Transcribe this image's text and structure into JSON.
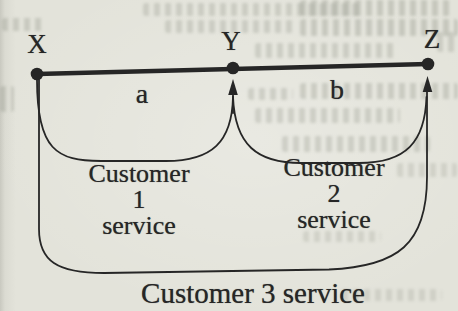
{
  "figure": {
    "points": [
      {
        "label": "X"
      },
      {
        "label": "Y"
      },
      {
        "label": "Z"
      }
    ],
    "segments": [
      {
        "label": "a",
        "between": "X-Y"
      },
      {
        "label": "b",
        "between": "Y-Z"
      }
    ],
    "service_arcs": [
      {
        "name": "Customer 1 service",
        "lines": [
          "Customer",
          "1",
          "service"
        ],
        "from": "X",
        "to": "Y"
      },
      {
        "name": "Customer 2 service",
        "lines": [
          "Customer",
          "2",
          "service"
        ],
        "from": "Y",
        "to": "Z"
      },
      {
        "name": "Customer 3 service",
        "from": "X",
        "to": "Z"
      }
    ],
    "colors": {
      "ink": "#262626",
      "paper": "#e3e3da"
    }
  }
}
